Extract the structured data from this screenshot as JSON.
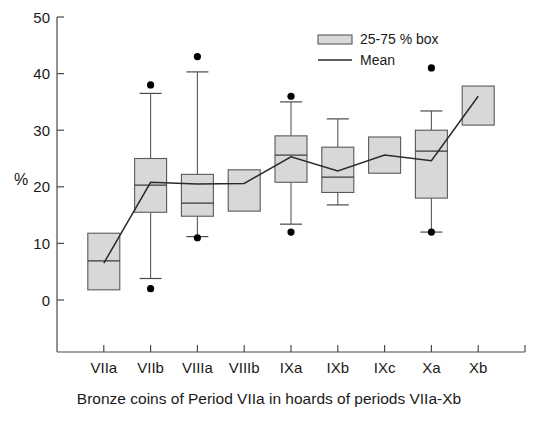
{
  "chart_data": {
    "type": "box",
    "title": "",
    "caption": "Bronze coins of Period VIIa in hoards of periods VIIa-Xb",
    "xlabel": "",
    "ylabel": "%",
    "ylim": [
      0,
      50
    ],
    "yticks": [
      0,
      10,
      20,
      30,
      40,
      50
    ],
    "ytick_labels": [
      "0",
      "10",
      "20",
      "30",
      "40",
      "50"
    ],
    "grid": false,
    "categories": [
      "VIIa",
      "VIIb",
      "VIIIa",
      "VIIIb",
      "IXa",
      "IXb",
      "IXc",
      "Xa",
      "Xb"
    ],
    "legend": {
      "position": "top-right",
      "entries": [
        {
          "key": "box",
          "label": "25-75 % box",
          "marker": "filled-rect"
        },
        {
          "key": "mean",
          "label": "Mean",
          "marker": "line"
        }
      ]
    },
    "boxes": [
      {
        "category": "VIIa",
        "q1": 1.8,
        "q3": 11.8,
        "median": 6.9,
        "whisker_low": null,
        "whisker_high": null,
        "outliers": []
      },
      {
        "category": "VIIb",
        "q1": 15.5,
        "q3": 25.0,
        "median": 20.3,
        "whisker_low": 3.8,
        "whisker_high": 36.5,
        "outliers": [
          38.0,
          2.0
        ]
      },
      {
        "category": "VIIIa",
        "q1": 14.8,
        "q3": 22.2,
        "median": 17.1,
        "whisker_low": 11.2,
        "whisker_high": 40.3,
        "outliers": [
          43.0,
          11.0
        ]
      },
      {
        "category": "VIIIb",
        "q1": 15.7,
        "q3": 23.0,
        "median": null,
        "whisker_low": null,
        "whisker_high": null,
        "outliers": []
      },
      {
        "category": "IXa",
        "q1": 20.8,
        "q3": 29.0,
        "median": 25.6,
        "whisker_low": 13.4,
        "whisker_high": 35.0,
        "outliers": [
          36.0,
          12.0
        ]
      },
      {
        "category": "IXb",
        "q1": 19.0,
        "q3": 27.0,
        "median": 21.7,
        "whisker_low": 16.8,
        "whisker_high": 32.0,
        "outliers": []
      },
      {
        "category": "IXc",
        "q1": 22.4,
        "q3": 28.8,
        "median": null,
        "whisker_low": null,
        "whisker_high": null,
        "outliers": []
      },
      {
        "category": "Xa",
        "q1": 18.0,
        "q3": 30.0,
        "median": 26.3,
        "whisker_low": 12.0,
        "whisker_high": 33.4,
        "outliers": [
          41.0,
          12.0
        ]
      },
      {
        "category": "Xb",
        "q1": 30.9,
        "q3": 37.8,
        "median": null,
        "whisker_low": null,
        "whisker_high": null,
        "outliers": []
      }
    ],
    "series": [
      {
        "name": "Mean",
        "values": [
          6.5,
          20.8,
          20.5,
          20.6,
          25.3,
          22.8,
          25.6,
          24.6,
          36.0
        ]
      }
    ]
  }
}
